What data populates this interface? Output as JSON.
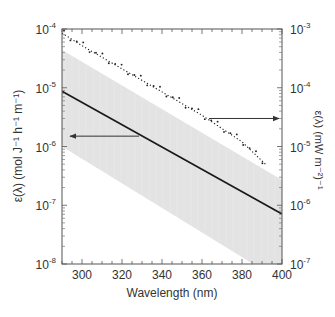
{
  "chart_data": {
    "type": "line",
    "title": "",
    "xlabel": "Wavelength (nm)",
    "ylabel_left": "ε(λ) (mol J⁻¹ h⁻¹ m⁻¹)",
    "ylabel_right": "ε(λ) (mW m⁻²)⁻¹",
    "xlim": [
      290,
      400
    ],
    "ylim_left": [
      1e-08,
      0.0001
    ],
    "ylim_right": [
      1e-07,
      0.001
    ],
    "yscale": "log",
    "grid": false,
    "x_ticks": [
      300,
      320,
      340,
      360,
      380,
      400
    ],
    "y_ticks_left": [
      {
        "base": "10",
        "exp": "-4",
        "value": 0.0001
      },
      {
        "base": "10",
        "exp": "-5",
        "value": 1e-05
      },
      {
        "base": "10",
        "exp": "-6",
        "value": 1e-06
      },
      {
        "base": "10",
        "exp": "-7",
        "value": 1e-07
      },
      {
        "base": "10",
        "exp": "-8",
        "value": 1e-08
      }
    ],
    "y_ticks_right": [
      {
        "base": "10",
        "exp": "-3",
        "value": 0.001
      },
      {
        "base": "10",
        "exp": "-4",
        "value": 0.0001
      },
      {
        "base": "10",
        "exp": "-5",
        "value": 1e-05
      },
      {
        "base": "10",
        "exp": "-6",
        "value": 1e-06
      },
      {
        "base": "10",
        "exp": "-7",
        "value": 1e-07
      }
    ],
    "series": [
      {
        "name": "mean spectral weighting (solid line)",
        "axis": "left",
        "style": "solid",
        "color": "#1a1a1a",
        "x": [
          290,
          400
        ],
        "values": [
          8.7e-06,
          7.1e-08
        ]
      },
      {
        "name": "spectral weighting (dotted line with points)",
        "axis": "right",
        "style": "dotted",
        "color": "#1a1a1a",
        "x": [
          290,
          300,
          320,
          340,
          360,
          380,
          392
        ],
        "values": [
          0.00085,
          0.00052,
          0.00021,
          8.5e-05,
          3.4e-05,
          1.2e-05,
          4.9e-06
        ]
      },
      {
        "name": "variability range (shaded band)",
        "axis": "left",
        "style": "band",
        "color": "#e3e3e3",
        "x": [
          290,
          400
        ],
        "upper": [
          4.4e-05,
          2.7e-07
        ],
        "lower": [
          1e-06,
          5e-09
        ]
      }
    ],
    "annotations": [
      {
        "type": "arrow",
        "direction": "left",
        "points_to": "left axis",
        "y_value_left": 1.5e-06
      },
      {
        "type": "arrow",
        "direction": "right",
        "points_to": "right axis",
        "y_value_right": 3e-05
      }
    ]
  }
}
